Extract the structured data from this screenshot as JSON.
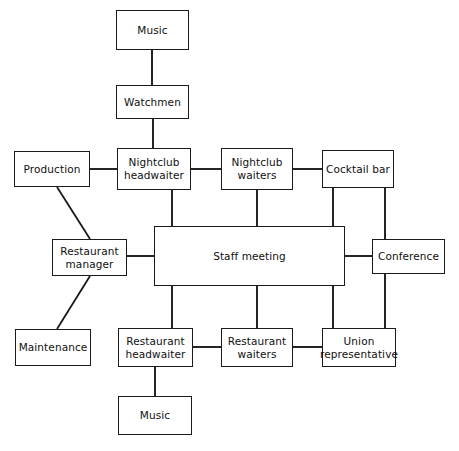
{
  "diagram": {
    "type": "organization-communication-network",
    "background_color": "#ffffff",
    "line_color": "#1a1a1a",
    "nodes": [
      {
        "id": "music-top",
        "label": "Music",
        "x": 116,
        "y": 10,
        "w": 73,
        "h": 40
      },
      {
        "id": "watchmen",
        "label": "Watchmen",
        "x": 116,
        "y": 85,
        "w": 73,
        "h": 34
      },
      {
        "id": "production",
        "label": "Production",
        "x": 14,
        "y": 151,
        "w": 76,
        "h": 36
      },
      {
        "id": "nightclub-headwaiter",
        "label": "Nightclub\nheadwaiter",
        "x": 117,
        "y": 148,
        "w": 74,
        "h": 42
      },
      {
        "id": "nightclub-waiters",
        "label": "Nightclub\nwaiters",
        "x": 221,
        "y": 148,
        "w": 72,
        "h": 42
      },
      {
        "id": "cocktail-bar",
        "label": "Cocktail bar",
        "x": 322,
        "y": 150,
        "w": 72,
        "h": 38
      },
      {
        "id": "restaurant-manager",
        "label": "Restaurant\nmanager",
        "x": 52,
        "y": 239,
        "w": 75,
        "h": 37
      },
      {
        "id": "staff-meeting",
        "label": "Staff meeting",
        "x": 154,
        "y": 226,
        "w": 191,
        "h": 60
      },
      {
        "id": "conference",
        "label": "Conference",
        "x": 372,
        "y": 239,
        "w": 73,
        "h": 35
      },
      {
        "id": "maintenance",
        "label": "Maintenance",
        "x": 15,
        "y": 329,
        "w": 76,
        "h": 37
      },
      {
        "id": "restaurant-headwaiter",
        "label": "Restaurant\nheadwaiter",
        "x": 118,
        "y": 328,
        "w": 75,
        "h": 39
      },
      {
        "id": "restaurant-waiters",
        "label": "Restaurant\nwaiters",
        "x": 221,
        "y": 328,
        "w": 72,
        "h": 39
      },
      {
        "id": "union-representative",
        "label": "Union\nrepresentative",
        "x": 322,
        "y": 328,
        "w": 74,
        "h": 39
      },
      {
        "id": "music-bottom",
        "label": "Music",
        "x": 118,
        "y": 396,
        "w": 74,
        "h": 39
      }
    ],
    "edges": [
      {
        "id": "music-top--watchmen",
        "from": "music-top",
        "to": "watchmen",
        "kind": "vertical",
        "points": "152,50 152,85"
      },
      {
        "id": "watchmen--nightclub-headwaiter",
        "from": "watchmen",
        "to": "nightclub-headwaiter",
        "kind": "vertical",
        "points": "153,119 153,148"
      },
      {
        "id": "production--nightclub-headwaiter",
        "from": "production",
        "to": "nightclub-headwaiter",
        "kind": "horizontal",
        "points": "90,169 117,169"
      },
      {
        "id": "nightclub-headwaiter--nightclub-waiters",
        "from": "nightclub-headwaiter",
        "to": "nightclub-waiters",
        "kind": "horizontal",
        "points": "191,169 221,169"
      },
      {
        "id": "nightclub-waiters--cocktail-bar",
        "from": "nightclub-waiters",
        "to": "cocktail-bar",
        "kind": "horizontal",
        "points": "293,169 322,169"
      },
      {
        "id": "production--restaurant-manager",
        "from": "production",
        "to": "restaurant-manager",
        "kind": "diagonal",
        "points": "57,187 90,239"
      },
      {
        "id": "restaurant-manager--maintenance",
        "from": "restaurant-manager",
        "to": "maintenance",
        "kind": "diagonal",
        "points": "90,276 57,329"
      },
      {
        "id": "restaurant-manager--staff-meeting",
        "from": "restaurant-manager",
        "to": "staff-meeting",
        "kind": "horizontal",
        "points": "127,256 154,256"
      },
      {
        "id": "nightclub-headwaiter--staff-meeting",
        "from": "nightclub-headwaiter",
        "to": "staff-meeting",
        "kind": "vertical",
        "points": "172,190 172,226"
      },
      {
        "id": "nightclub-waiters--staff-meeting",
        "from": "nightclub-waiters",
        "to": "staff-meeting",
        "kind": "vertical",
        "points": "257,190 257,226"
      },
      {
        "id": "cocktail-bar--staff-meeting",
        "from": "cocktail-bar",
        "to": "staff-meeting",
        "kind": "vertical",
        "points": "333,188 333,226"
      },
      {
        "id": "cocktail-bar--conference",
        "from": "cocktail-bar",
        "to": "conference",
        "kind": "vertical",
        "points": "385,188 385,239"
      },
      {
        "id": "staff-meeting--conference",
        "from": "staff-meeting",
        "to": "conference",
        "kind": "horizontal",
        "points": "345,256 372,256"
      },
      {
        "id": "conference--union-representative",
        "from": "conference",
        "to": "union-representative",
        "kind": "vertical",
        "points": "385,274 385,328"
      },
      {
        "id": "staff-meeting--restaurant-headwaiter",
        "from": "staff-meeting",
        "to": "restaurant-headwaiter",
        "kind": "vertical",
        "points": "172,286 172,328"
      },
      {
        "id": "staff-meeting--restaurant-waiters",
        "from": "staff-meeting",
        "to": "restaurant-waiters",
        "kind": "vertical",
        "points": "257,286 257,328"
      },
      {
        "id": "staff-meeting--union-representative",
        "from": "staff-meeting",
        "to": "union-representative",
        "kind": "vertical",
        "points": "333,286 333,328"
      },
      {
        "id": "restaurant-headwaiter--restaurant-waiters",
        "from": "restaurant-headwaiter",
        "to": "restaurant-waiters",
        "kind": "horizontal",
        "points": "193,347 221,347"
      },
      {
        "id": "restaurant-waiters--union-representative",
        "from": "restaurant-waiters",
        "to": "union-representative",
        "kind": "horizontal",
        "points": "293,347 322,347"
      },
      {
        "id": "restaurant-headwaiter--music-bottom",
        "from": "restaurant-headwaiter",
        "to": "music-bottom",
        "kind": "vertical",
        "points": "155,367 155,396"
      }
    ]
  }
}
